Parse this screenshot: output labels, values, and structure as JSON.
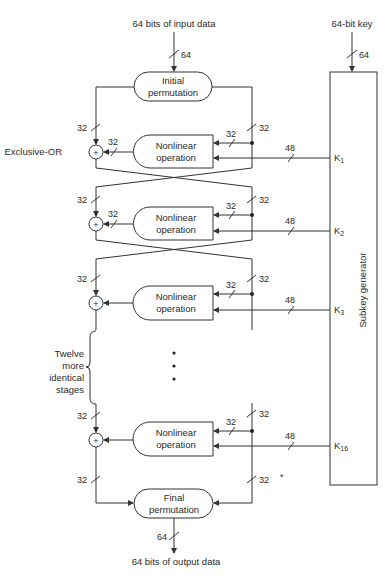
{
  "diagram": {
    "input_label": "64 bits of input data",
    "input_width": "64",
    "key_label": "64-bit key",
    "key_width": "64",
    "initial_permutation": [
      "Initial",
      "permutation"
    ],
    "final_permutation": [
      "Final",
      "permutation"
    ],
    "output_label": "64 bits of output data",
    "output_width": "64",
    "xor_label": "Exclusive-OR",
    "xor_symbol": "+",
    "subkey_generator_label": "Subkey generator",
    "nonlinear_label": [
      "Nonlinear",
      "operation"
    ],
    "half_width": "32",
    "subkey_width": "48",
    "stages": [
      {
        "key": "K",
        "sub": "1"
      },
      {
        "key": "K",
        "sub": "2"
      },
      {
        "key": "K",
        "sub": "3"
      },
      {
        "key": "K",
        "sub": "16"
      }
    ],
    "ellipsis_note": [
      "Twelve",
      "more",
      "identical",
      "stages"
    ],
    "stray_mark": "*"
  }
}
